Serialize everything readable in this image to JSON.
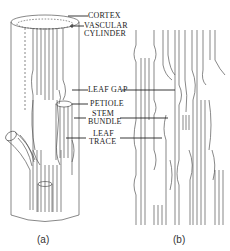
{
  "figure": {
    "labels": {
      "cortex": "CORTEX",
      "vascular_cylinder_line1": "VASCULAR",
      "vascular_cylinder_line2": "CYLINDER",
      "leaf_gap": "LEAF GAP",
      "petiole": "PETIOLE",
      "stem_bundle_line1": "STEM",
      "stem_bundle_line2": "BUNDLE",
      "leaf_trace_line1": "LEAF",
      "leaf_trace_line2": "TRACE"
    },
    "captions": {
      "a": "(a)",
      "b": "(b)"
    },
    "colors": {
      "line": "#555555",
      "leader": "#222222",
      "background": "#ffffff"
    }
  }
}
